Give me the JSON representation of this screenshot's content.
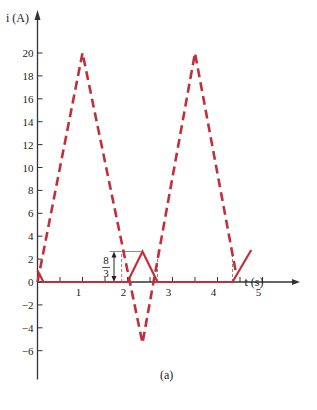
{
  "chart_data": {
    "type": "line",
    "title": "",
    "xlabel": "t (s)",
    "ylabel": "i (A)",
    "caption": "(a)",
    "xlim": [
      0,
      5.3
    ],
    "ylim": [
      -8,
      22
    ],
    "x_ticks": [
      1,
      2,
      3,
      4,
      5
    ],
    "x_minor_ticks": [
      0.5,
      1.5,
      2.5,
      3.5,
      4.5
    ],
    "y_ticks": [
      -6,
      -4,
      -2,
      0,
      2,
      4,
      6,
      8,
      10,
      12,
      14,
      16,
      18,
      20
    ],
    "grid": false,
    "legend": null,
    "annotation": {
      "label_num": "8",
      "label_den": "3",
      "value": 2.667,
      "description": "peak height of solid triangle"
    },
    "series": [
      {
        "name": "dashed",
        "style": "dashed",
        "color": "#c0303a",
        "x": [
          0,
          1,
          2.333,
          3.5,
          4.42
        ],
        "y": [
          0,
          20,
          -5.333,
          20,
          0.6
        ]
      },
      {
        "name": "solid",
        "style": "solid",
        "color": "#c0303a",
        "x": [
          0,
          0.133,
          2.0,
          2.333,
          2.667,
          4.333,
          4.75
        ],
        "y": [
          1,
          0,
          0,
          2.667,
          0,
          0,
          2.8
        ]
      }
    ],
    "guides": {
      "vertical_dashed_t": [
        1.87,
        2.667,
        4.333
      ],
      "horizontal_line_y": 2.667
    }
  },
  "labels": {
    "ylabel": "i (A)",
    "xlabel": "t (s)",
    "caption": "(a)",
    "frac_num": "8",
    "frac_den": "3"
  }
}
